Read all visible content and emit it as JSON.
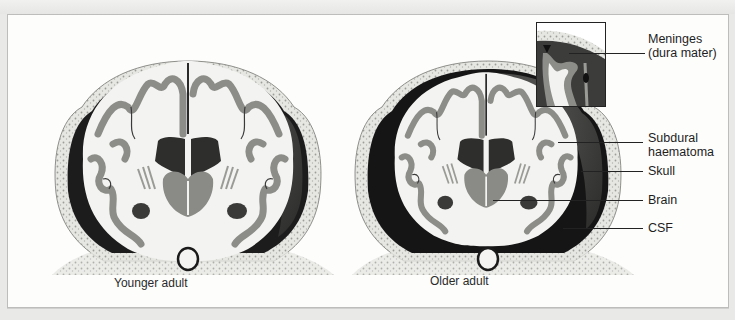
{
  "figure": {
    "panels": [
      {
        "id": "younger",
        "caption": "Younger adult"
      },
      {
        "id": "older",
        "caption": "Older adult"
      }
    ],
    "labels": {
      "meninges_line1": "Meninges",
      "meninges_line2": "(dura mater)",
      "subdural_line1": "Subdural",
      "subdural_line2": "haematoma",
      "skull": "Skull",
      "brain": "Brain",
      "csf": "CSF"
    },
    "colors": {
      "skull": "#e4e4e1",
      "skull_dots": "#9a9a96",
      "white_matter": "#f4f4f2",
      "grey_matter": "#8d8d8a",
      "haematoma": "#4c4c4b",
      "csf": "#151515",
      "background": "#fdfdfc"
    }
  }
}
